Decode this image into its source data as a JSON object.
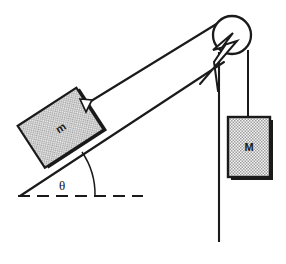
{
  "figure": {
    "kind": "physics-free-body-diagram",
    "background_color": "#ffffff",
    "line_color": "#1a1a1a",
    "fill_pattern_color": "#9a9a9a",
    "fill_background_color": "#f2f2f2"
  },
  "labels": {
    "incline_mass": "m",
    "hanging_mass": "M",
    "angle": "θ"
  },
  "elements": {
    "incline_surface_name": "incline-surface",
    "ground_line_name": "ground-dashed-line",
    "angle_arc_name": "angle-arc",
    "rope_incline_name": "rope-incline-segment",
    "rope_vertical_name": "rope-vertical-segment",
    "pulley_name": "pulley-wheel",
    "support_rod_name": "pulley-support-rod",
    "block_m_name": "block-m",
    "block_M_name": "block-big-m"
  },
  "geometry": {
    "pulley": {
      "cx": 232,
      "cy": 35,
      "r": 19
    },
    "incline_vertex": {
      "x": 20,
      "y": 196
    },
    "incline_top": {
      "x": 222,
      "y": 66
    },
    "ground_end": {
      "x": 143,
      "y": 196
    },
    "angle_degrees": 35,
    "block_m": {
      "cx": 62,
      "cy": 128,
      "w": 72,
      "h": 52,
      "rotation": -33
    },
    "block_big_m": {
      "x": 228,
      "y": 117,
      "w": 42,
      "h": 60
    },
    "support_rod_bottom_y": 242
  }
}
